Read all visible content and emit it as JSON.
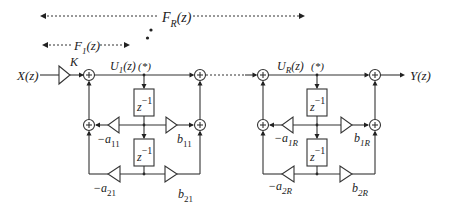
{
  "diagram": {
    "input_label": "X(z)",
    "output_label": "Y(z)",
    "gain_label": "K",
    "ranges": {
      "FR": {
        "name": "F",
        "sub": "R",
        "arg": "(z)"
      },
      "F1": {
        "name": "F",
        "sub": "1",
        "arg": "(z)"
      }
    },
    "sections": [
      {
        "id": "section-1",
        "state": {
          "name": "U",
          "sub": "1",
          "arg": "(z)",
          "marker": "(*)"
        },
        "delay_label": "z",
        "delay_exp": "−1",
        "feedback": [
          {
            "sign": "−a",
            "sub": "11"
          },
          {
            "sign": "−a",
            "sub": "21"
          }
        ],
        "feedforward": [
          {
            "name": "b",
            "sub": "11"
          },
          {
            "name": "b",
            "sub": "21"
          }
        ]
      },
      {
        "id": "section-R",
        "state": {
          "name": "U",
          "sub": "R",
          "arg": "(z)",
          "marker": "(*)"
        },
        "delay_label": "z",
        "delay_exp": "−1",
        "feedback": [
          {
            "sign": "−a",
            "sub": "1R"
          },
          {
            "sign": "−a",
            "sub": "2R"
          }
        ],
        "feedforward": [
          {
            "name": "b",
            "sub": "1R"
          },
          {
            "name": "b",
            "sub": "2R"
          }
        ]
      }
    ],
    "colors": {
      "line": "#333333",
      "text": "#222222",
      "background": "#ffffff"
    }
  }
}
